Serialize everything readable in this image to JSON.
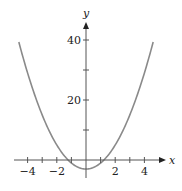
{
  "chart_data": {
    "type": "line",
    "title": "",
    "xlabel": "x",
    "ylabel": "y",
    "xlim": [
      -4.9,
      5.2
    ],
    "ylim": [
      -6,
      46
    ],
    "x_ticks": [
      -4,
      -3,
      -2,
      -1,
      1,
      2,
      3,
      4
    ],
    "x_tick_labels": [
      "−4",
      "−2",
      "2",
      "4"
    ],
    "x_tick_label_values": [
      -4,
      -2,
      2,
      4
    ],
    "y_ticks": [
      10,
      20,
      30,
      40
    ],
    "y_tick_labels": [
      "20",
      "40"
    ],
    "y_tick_label_values": [
      20,
      40
    ],
    "grid": false,
    "legend": null,
    "series": [
      {
        "name": "parabola",
        "function": "y = 2x^2 - 3",
        "x": [
          -4.6,
          -4,
          -3,
          -2,
          -1.22,
          -1,
          0,
          1,
          1.22,
          2,
          3,
          4,
          4.6
        ],
        "y": [
          39.3,
          29,
          15,
          5,
          0,
          -1,
          -3,
          -1,
          0,
          5,
          15,
          29,
          39.3
        ],
        "color": "#8a8a8a"
      }
    ]
  },
  "colors": {
    "axis": "#555555",
    "curve": "#8a8a8a",
    "text": "#222222"
  }
}
